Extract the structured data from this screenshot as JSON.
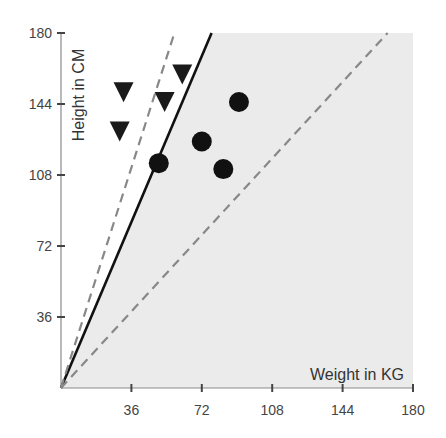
{
  "chart_data": {
    "type": "scatter",
    "title": "",
    "xlabel": "Weight in KG",
    "ylabel": "Height in CM",
    "xlim": [
      0,
      180
    ],
    "ylim": [
      0,
      180
    ],
    "xticks": [
      36,
      72,
      108,
      144,
      180
    ],
    "yticks": [
      36,
      72,
      108,
      144,
      180
    ],
    "grid": false,
    "legend": null,
    "series": [
      {
        "name": "triangles",
        "marker": "triangle-down",
        "color": "#1a1a1a",
        "points": [
          {
            "x": 32,
            "y": 150
          },
          {
            "x": 30,
            "y": 130
          },
          {
            "x": 62,
            "y": 159
          },
          {
            "x": 53,
            "y": 145
          }
        ]
      },
      {
        "name": "circles",
        "marker": "circle",
        "color": "#111111",
        "points": [
          {
            "x": 91,
            "y": 145
          },
          {
            "x": 72,
            "y": 125
          },
          {
            "x": 50,
            "y": 114
          },
          {
            "x": 83,
            "y": 111
          }
        ]
      }
    ],
    "lines": [
      {
        "name": "decision-boundary",
        "style": "solid",
        "color": "#111111",
        "from": [
          0,
          0
        ],
        "to": [
          77,
          180
        ]
      },
      {
        "name": "margin-upper",
        "style": "dashed",
        "color": "#888888",
        "from": [
          0,
          0
        ],
        "to": [
          58,
          180
        ]
      },
      {
        "name": "margin-lower",
        "style": "dashed",
        "color": "#888888",
        "from": [
          0,
          0
        ],
        "to": [
          167,
          180
        ]
      }
    ],
    "shaded_region": {
      "description": "region right of solid boundary",
      "color": "#ebebeb"
    }
  }
}
